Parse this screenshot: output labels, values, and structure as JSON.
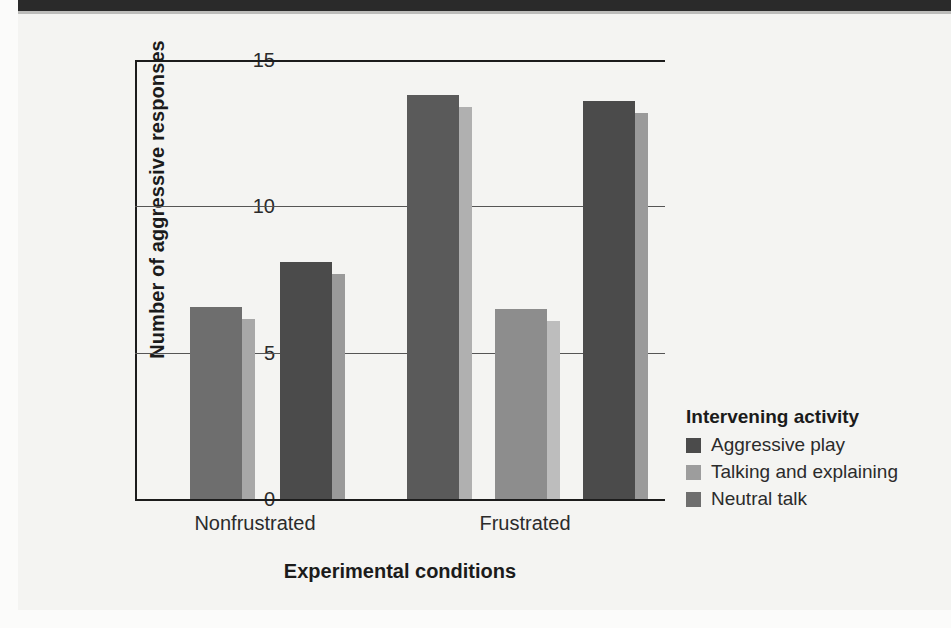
{
  "chart_data": {
    "type": "bar",
    "title": "",
    "xlabel": "Experimental conditions",
    "ylabel": "Number of aggressive responses",
    "categories": [
      "Nonfrustrated",
      "Frustrated"
    ],
    "ylim": [
      0,
      15
    ],
    "yticks": [
      "0",
      "5",
      "10",
      "15"
    ],
    "ytick_values": [
      0,
      5,
      10,
      15
    ],
    "grid": true,
    "legend_position": "right",
    "legend_title": "Intervening activity",
    "series": [
      {
        "name": "Aggressive play",
        "color": "#4b4b4b",
        "side_color": "#9a9a9a",
        "values": [
          8.1,
          13.8
        ]
      },
      {
        "name": "Talking and explaining",
        "color": "#9d9d9d",
        "side_color": "#c4c4c4",
        "values": [
          null,
          6.5
        ]
      },
      {
        "name": "Neutral talk",
        "color": "#6e6e6e",
        "side_color": "#a8a8a8",
        "values": [
          6.55,
          13.6
        ]
      }
    ],
    "bars": [
      {
        "label": "Nonfrustrated / Neutral talk",
        "group": "Nonfrustrated",
        "series": "Neutral talk",
        "value": 6.55,
        "x": 55,
        "width": 52,
        "color": "#6e6e6e",
        "side_color": "#a8a8a8"
      },
      {
        "label": "Nonfrustrated / Aggressive play",
        "group": "Nonfrustrated",
        "series": "Aggressive play",
        "value": 8.1,
        "x": 145,
        "width": 52,
        "color": "#4b4b4b",
        "side_color": "#9a9a9a"
      },
      {
        "label": "Frustrated / Aggressive play",
        "group": "Frustrated",
        "series": "Aggressive play",
        "value": 13.8,
        "x": 272,
        "width": 52,
        "color": "#5a5a5a",
        "side_color": "#b0b0b0"
      },
      {
        "label": "Frustrated / Talking and explaining",
        "group": "Frustrated",
        "series": "Talking and explaining",
        "value": 6.5,
        "x": 360,
        "width": 52,
        "color": "#8d8d8d",
        "side_color": "#bdbdbd"
      },
      {
        "label": "Frustrated / Neutral talk",
        "group": "Frustrated",
        "series": "Neutral talk",
        "value": 13.6,
        "x": 448,
        "width": 52,
        "color": "#4b4b4b",
        "side_color": "#9a9a9a"
      }
    ],
    "category_centers": [
      120,
      390
    ]
  },
  "colors": {
    "page_background": "#f4f4f2",
    "header_band": "#2a2a2a",
    "axis": "#1c1c1c",
    "gridline": "#555555",
    "text": "#2b2b2b",
    "bold_text": "#1b1b1b"
  }
}
